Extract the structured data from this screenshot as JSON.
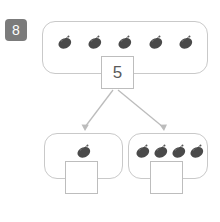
{
  "worksheet": {
    "question_number": "8",
    "type": "number-bond-decomposition",
    "whole": {
      "value": "5",
      "item_icon": "strawberry-icon",
      "item_count": 5
    },
    "parts": [
      {
        "item_icon": "strawberry-icon",
        "item_count": 1,
        "answer_value": ""
      },
      {
        "item_icon": "strawberry-icon",
        "item_count": 4,
        "answer_value": ""
      }
    ],
    "arrows": [
      {
        "name": "arrow-to-left-part"
      },
      {
        "name": "arrow-to-right-part"
      }
    ]
  },
  "colors": {
    "badge_background": "#7b7b7b",
    "badge_text": "#ffffff",
    "group_border": "#c9c9c9",
    "box_border": "#bdbdbd",
    "number_text": "#5a5a5a",
    "fruit_body": "#4a4a4a",
    "fruit_stem": "#6e6e6e",
    "arrow": "#bcbcbc",
    "page_background": "#ffffff"
  }
}
